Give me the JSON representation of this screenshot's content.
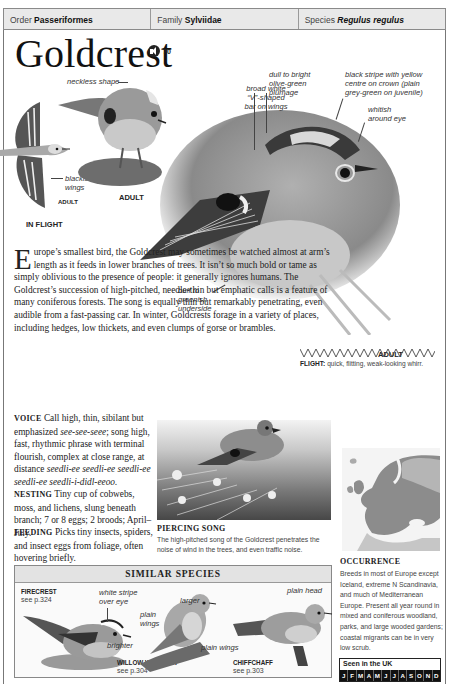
{
  "taxonomy": {
    "order_label": "Order",
    "order_value": "Passeriformes",
    "family_label": "Family",
    "family_value": "Sylviidae",
    "species_label": "Species",
    "species_value": "Regulus regulus"
  },
  "title": "Goldcrest",
  "audio": {
    "icon": "speaker-icon",
    "track_number": "70"
  },
  "illustrations": {
    "in_flight": {
      "caption": "IN FLIGHT",
      "sub_caption": "ADULT",
      "labels": [
        "blackish wings"
      ]
    },
    "perched_small": {
      "caption": "ADULT",
      "labels": [
        "neckless shape"
      ]
    },
    "main": {
      "caption": "ADULT",
      "labels": [
        "broad white \"V\"-shaped bar on wings",
        "dull to bright olive-green plumage",
        "black stripe with yellow centre on crown (plain grey-green on juvenile)",
        "whitish around eye",
        "buff to greenish underside"
      ]
    }
  },
  "description": {
    "dropcap": "E",
    "text": "urope’s smallest bird, the Goldcrest may sometimes be watched almost at arm’s length as it feeds in lower branches of trees. It isn’t so much bold or tame as simply oblivious to the presence of people: it generally ignores humans. The Goldcrest’s succession of high-pitched, needle-thin but emphatic calls is a feature of many coniferous forests. The song is equally thin but remarkably penetrating, even audible from a fast-passing car. In winter, Goldcrests forage in a variety of places, including hedges, low thickets, and even clumps of gorse or brambles."
  },
  "sections": {
    "voice": {
      "heading": "VOICE",
      "text_a": "Call high, thin, sibilant but emphasized ",
      "call_italic": "see-see-seee",
      "text_b": "; song high, fast, rhythmic phrase with terminal flourish, complex at close range, at distance ",
      "song_italic": "seedli-ee seedli-ee seedli-ee seedli-ee seedli-i-didl-eeoo."
    },
    "nesting": {
      "heading": "NESTING",
      "text": "Tiny cup of cobwebs, moss, and lichens, slung beneath branch; 7 or 8 eggs; 2 broods; April–July."
    },
    "feeding": {
      "heading": "FEEDING",
      "text": "Picks tiny insects, spiders, and insect eggs from foliage, often hovering briefly."
    }
  },
  "flight": {
    "label": "FLIGHT:",
    "text": "quick, flitting, weak-looking whirr."
  },
  "photo": {
    "title": "PIERCING SONG",
    "caption": "The high-pitched song of the Goldcrest penetrates the noise of wind in the trees, and even traffic noise."
  },
  "occurrence": {
    "title": "OCCURRENCE",
    "text": "Breeds in most of Europe except Iceland, extreme N Scandinavia, and much of Mediterranean Europe. Present all year round in mixed and coniferous woodland, parks, and large wooded gardens; coastal migrants can be in very low scrub.",
    "seen_title": "Seen in the UK",
    "months": [
      "J",
      "F",
      "M",
      "A",
      "M",
      "J",
      "J",
      "A",
      "S",
      "O",
      "N",
      "D"
    ]
  },
  "similar_species": {
    "heading": "SIMILAR SPECIES",
    "items": [
      {
        "name": "FIRECREST",
        "ref": "see p.324",
        "labels": [
          "white stripe over eye",
          "brighter"
        ]
      },
      {
        "name": "WILLOW WARBLER",
        "ref": "see p.304",
        "labels": [
          "larger",
          "plain wings"
        ]
      },
      {
        "name": "CHIFFCHAFF",
        "ref": "see p.303",
        "labels": [
          "plain head",
          "plain wings"
        ]
      }
    ]
  },
  "colors": {
    "header_bar": "#e9e9e9",
    "border": "#8a8a8a",
    "month_bar": "#111111",
    "text": "#222222"
  }
}
